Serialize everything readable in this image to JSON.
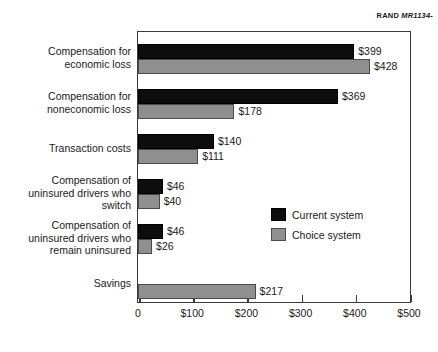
{
  "source_credit": {
    "organization": "RAND",
    "code": "MR1134-"
  },
  "chart_data": {
    "type": "bar",
    "orientation": "horizontal",
    "title": "",
    "subtitle": "",
    "xlabel": "",
    "ylabel": "",
    "xlim": [
      0,
      500
    ],
    "xticks": [
      0,
      100,
      200,
      300,
      400,
      500
    ],
    "xtick_labels": [
      "0",
      "$100",
      "$200",
      "$300",
      "$400",
      "$500"
    ],
    "grid": false,
    "legend_position": "inside-right-middle",
    "categories": [
      "Compensation for economic loss",
      "Compensation for noneconomic loss",
      "Transaction costs",
      "Compensation of uninsured drivers who switch",
      "Compensation of uninsured drivers who remain uninsured",
      "Savings"
    ],
    "category_lines": [
      [
        "Compensation for",
        "economic loss"
      ],
      [
        "Compensation for",
        "noneconomic loss"
      ],
      [
        "Transaction costs"
      ],
      [
        "Compensation of",
        "uninsured drivers who",
        "switch"
      ],
      [
        "Compensation of",
        "uninsured drivers who",
        "remain uninsured"
      ],
      [
        "Savings"
      ]
    ],
    "series": [
      {
        "name": "Current system",
        "color": "#0d0d0d",
        "values": [
          399,
          369,
          140,
          46,
          46,
          null
        ],
        "value_labels": [
          "$399",
          "$369",
          "$140",
          "$46",
          "$46",
          ""
        ]
      },
      {
        "name": "Choice system",
        "color": "#8f8f8f",
        "values": [
          428,
          178,
          111,
          40,
          26,
          217
        ],
        "value_labels": [
          "$428",
          "$178",
          "$111",
          "$40",
          "$26",
          "$217"
        ]
      }
    ]
  },
  "legend": {
    "items": [
      {
        "label": "Current system",
        "color": "#0d0d0d"
      },
      {
        "label": "Choice system",
        "color": "#8f8f8f"
      }
    ]
  }
}
